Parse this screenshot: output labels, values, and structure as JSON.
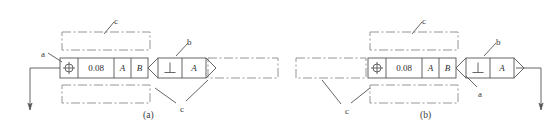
{
  "figure": {
    "line_color": "#555555",
    "phantom_color": "#8a8a8a",
    "text_color": "#3a3a3a"
  },
  "panels": [
    {
      "id": "a",
      "caption": "(a)",
      "caption_x": 143,
      "caption_y": 110,
      "frame1": {
        "x": 60,
        "y": 58,
        "w": 88,
        "h": 20,
        "cells": [
          {
            "type": "symbol",
            "name": "position-symbol",
            "value": "⊕",
            "w": 18
          },
          {
            "type": "text",
            "name": "tolerance-value",
            "value": "0.08",
            "w": 36
          },
          {
            "type": "text",
            "name": "datum-a",
            "value": "A",
            "italic": true,
            "w": 17
          },
          {
            "type": "text",
            "name": "datum-b",
            "value": "B",
            "italic": true,
            "w": 17
          }
        ]
      },
      "frame2": {
        "x": 158,
        "y": 58,
        "w": 48,
        "h": 20,
        "cells": [
          {
            "type": "symbol",
            "name": "perpendicularity-symbol",
            "value": "⊥",
            "w": 24
          },
          {
            "type": "text",
            "name": "datum-a",
            "value": "A",
            "italic": true,
            "w": 24
          }
        ],
        "left_chevron": true,
        "right_chevron": true
      },
      "phantom_boxes": [
        {
          "name": "phantom-box-top",
          "x": 62,
          "y": 32,
          "w": 88,
          "h": 18
        },
        {
          "name": "phantom-box-bottom",
          "x": 62,
          "y": 85,
          "w": 88,
          "h": 18
        },
        {
          "name": "phantom-box-right",
          "x": 208,
          "y": 58,
          "w": 70,
          "h": 20
        }
      ],
      "labels": [
        {
          "name": "label-a",
          "text": "a",
          "x": 41,
          "y": 50,
          "leader": [
            [
              48,
              53
            ],
            [
              62,
              62
            ]
          ]
        },
        {
          "name": "label-b",
          "text": "b",
          "x": 187,
          "y": 38,
          "leader": [
            [
              188,
              43
            ],
            [
              176,
              56
            ]
          ]
        },
        {
          "name": "label-c-top",
          "text": "c",
          "x": 114,
          "y": 17,
          "leader": [
            [
              114,
              22
            ],
            [
              104,
              34
            ]
          ]
        },
        {
          "name": "label-c-bottom",
          "text": "c",
          "x": 180,
          "y": 105,
          "leader2": [
            [
              [
                176,
                103
              ],
              [
                155,
                88
              ]
            ],
            [
              [
                186,
                101
              ],
              [
                208,
                80
              ]
            ]
          ]
        }
      ],
      "leader_line": {
        "name": "datum-leader-line",
        "points": [
          [
            60,
            68
          ],
          [
            30,
            68
          ],
          [
            30,
            110
          ]
        ],
        "arrow_at": [
          30,
          110
        ],
        "arrow_dir": "down"
      }
    },
    {
      "id": "b",
      "caption": "(b)",
      "caption_x": 420,
      "caption_y": 110,
      "frame1": {
        "x": 368,
        "y": 58,
        "w": 88,
        "h": 20,
        "cells": [
          {
            "type": "symbol",
            "name": "position-symbol",
            "value": "⊕",
            "w": 18
          },
          {
            "type": "text",
            "name": "tolerance-value",
            "value": "0.08",
            "w": 36
          },
          {
            "type": "text",
            "name": "datum-a",
            "value": "A",
            "italic": true,
            "w": 17
          },
          {
            "type": "text",
            "name": "datum-b",
            "value": "B",
            "italic": true,
            "w": 17
          }
        ]
      },
      "frame2": {
        "x": 466,
        "y": 58,
        "w": 48,
        "h": 20,
        "cells": [
          {
            "type": "symbol",
            "name": "perpendicularity-symbol",
            "value": "⊥",
            "w": 24
          },
          {
            "type": "text",
            "name": "datum-a",
            "value": "A",
            "italic": true,
            "w": 24
          }
        ],
        "left_chevron": true,
        "right_chevron": true
      },
      "phantom_boxes": [
        {
          "name": "phantom-box-top",
          "x": 370,
          "y": 32,
          "w": 88,
          "h": 18
        },
        {
          "name": "phantom-box-bottom",
          "x": 370,
          "y": 85,
          "w": 88,
          "h": 18
        },
        {
          "name": "phantom-box-left",
          "x": 296,
          "y": 58,
          "w": 70,
          "h": 20
        }
      ],
      "labels": [
        {
          "name": "label-a",
          "text": "a",
          "x": 478,
          "y": 90,
          "leader": [
            [
              477,
              87
            ],
            [
              466,
              76
            ]
          ]
        },
        {
          "name": "label-b",
          "text": "b",
          "x": 496,
          "y": 38,
          "leader": [
            [
              496,
              43
            ],
            [
              484,
              56
            ]
          ]
        },
        {
          "name": "label-c-top",
          "text": "c",
          "x": 422,
          "y": 17,
          "leader": [
            [
              422,
              22
            ],
            [
              412,
              34
            ]
          ]
        },
        {
          "name": "label-c-bottom",
          "text": "c",
          "x": 345,
          "y": 107,
          "leader2": [
            [
              [
                341,
                104
              ],
              [
                322,
                80
              ]
            ],
            [
              [
                351,
                103
              ],
              [
                370,
                88
              ]
            ]
          ]
        }
      ],
      "leader_line": {
        "name": "datum-leader-line",
        "points": [
          [
            516,
            68
          ],
          [
            541,
            68
          ],
          [
            541,
            110
          ]
        ],
        "arrow_at": [
          541,
          110
        ],
        "arrow_dir": "down"
      }
    }
  ]
}
